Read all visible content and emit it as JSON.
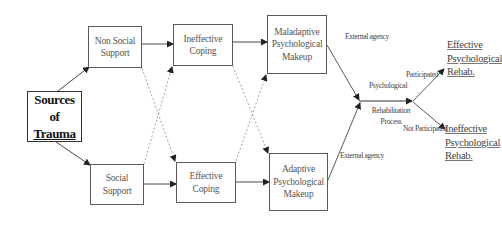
{
  "diagram": {
    "source": {
      "line1": "Sources of",
      "line2": "Trauma"
    },
    "support": {
      "non_social": {
        "line1": "Non Social",
        "line2": "Support"
      },
      "social": {
        "line1": "Social",
        "line2": "Support"
      }
    },
    "coping": {
      "ineffective": {
        "line1": "Ineffective",
        "line2": "Coping"
      },
      "effective": {
        "line1": "Effective",
        "line2": "Coping"
      }
    },
    "makeup": {
      "maladaptive": {
        "line1": "Maladaptive",
        "line2": "Psychological",
        "line3": "Makeup"
      },
      "adaptive": {
        "line1": "Adaptive",
        "line2": "Psychological",
        "line3": "Makeup"
      }
    },
    "edge_labels": {
      "external_agency_top": "External agency",
      "external_agency_bottom": "External agency",
      "process_line1": "Psychological",
      "process_line2": "Rehabilitation",
      "process_line3": "Process",
      "participated": "Participated",
      "not_participated": "Not Participated"
    },
    "outcomes": {
      "effective": {
        "line1": "Effective",
        "line2": "Psychological",
        "line3": "Rehab."
      },
      "ineffective": {
        "line1": "Ineffective",
        "line2": "Psychological",
        "line3": "Rehab."
      }
    },
    "colors": {
      "line": "#4a4a4a",
      "dashed": "#9a9a9a",
      "main_border": "#333333"
    }
  }
}
